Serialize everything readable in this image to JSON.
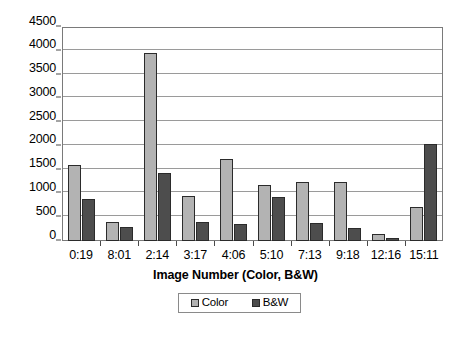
{
  "chart_data": {
    "type": "bar",
    "title": "",
    "xlabel": "Image Number (Color, B&W)",
    "ylabel": "",
    "categories": [
      "0:19",
      "8:01",
      "2:14",
      "3:17",
      "4:06",
      "5:10",
      "7:13",
      "9:18",
      "12:16",
      "15:11"
    ],
    "series": [
      {
        "name": "Color",
        "color": "#b3b3b3",
        "values": [
          1600,
          390,
          3950,
          940,
          1720,
          1175,
          1250,
          1235,
          145,
          710
        ]
      },
      {
        "name": "B&W",
        "color": "#4d4d4d",
        "values": [
          890,
          300,
          1425,
          400,
          355,
          925,
          370,
          280,
          55,
          2030
        ]
      }
    ],
    "ylim": [
      0,
      4500
    ],
    "ytick_labels": [
      "4500",
      "4000",
      "3500",
      "3000",
      "2500",
      "2000",
      "1500",
      "1000",
      "500",
      "0"
    ],
    "ytick_values": [
      4500,
      4000,
      3500,
      3000,
      2500,
      2000,
      1500,
      1000,
      500,
      0
    ],
    "ytick_step": 500,
    "grid": true,
    "legend_position": "bottom"
  },
  "legend": {
    "entries": [
      {
        "label": "Color"
      },
      {
        "label": "B&W"
      }
    ]
  }
}
